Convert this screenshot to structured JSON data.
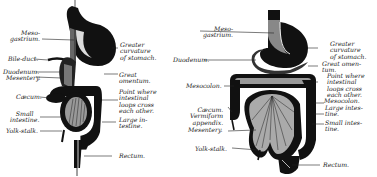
{
  "diagram": {
    "colors": {
      "ink": "#111111",
      "paper": "#ffffff",
      "label": "#1a1a1a"
    },
    "figures": [
      {
        "id": "early-stage",
        "labels": {
          "mesogastrium": "Meso-\ngastrium.",
          "bile_duct": "Bile-duct.",
          "duodenum": "Duodenum.",
          "mesentery": "Mesentery.",
          "cecum": "Cæcum.",
          "small_intestine": "Small\nintestine.",
          "yolk_stalk": "Yolk-stalk.",
          "greater_curvature": "Greater\ncurvature\nof stomach.",
          "great_omentum": "Great\nomentum.",
          "crossing_point": "Point where\nintestinal\nloops cross\neach other.",
          "large_intestine": "Large in-\ntestine.",
          "rectum": "Rectum."
        }
      },
      {
        "id": "later-stage",
        "labels": {
          "mesogastrium": "Meso-\ngastrium.",
          "duodenum": "Duodenum.",
          "mesocolon_left": "Mesocolon.",
          "cecum_appendix": "Cæcum.\nVermiform\nappendix.",
          "mesentery": "Mesentery.",
          "yolk_stalk": "Yolk-stalk.",
          "greater_curvature": "Greater\ncurvature\nof stomach.",
          "great_omentum": "Great omen-\ntum.",
          "crossing_point": "Point where\nintestinal\nloops cross\neach other.",
          "mesocolon_right": "Mesocolon.",
          "large_intestine": "Large intes-\ntine.",
          "small_intestine": "Small intes-\ntine.",
          "rectum": "Rectum."
        }
      }
    ]
  }
}
